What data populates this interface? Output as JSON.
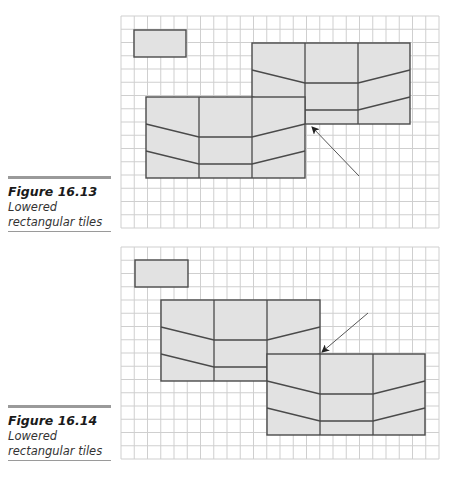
{
  "figures": [
    {
      "caption": {
        "title": "Figure 16.13",
        "line1": "Lowered",
        "line2": "rectangular tiles"
      },
      "grid": {
        "x": 121,
        "y": 16,
        "cols": 24,
        "rows": 16,
        "cell": 13.25
      },
      "small_rect": {
        "x": 134,
        "y": 30,
        "w": 52,
        "h": 27
      },
      "blocks": [
        {
          "x": 252,
          "y": 43,
          "w": 158,
          "h": 81,
          "cols": [
            305,
            358
          ],
          "lines": [
            [
              252,
              70,
              305,
              83,
              358,
              83,
              410,
              70
            ],
            [
              252,
              97,
              305,
              110,
              358,
              110,
              410,
              97
            ]
          ]
        },
        {
          "x": 146,
          "y": 97,
          "w": 159,
          "h": 81,
          "cols": [
            199,
            252
          ],
          "lines": [
            [
              146,
              124,
              199,
              137,
              252,
              137,
              305,
              124
            ],
            [
              146,
              151,
              199,
              164,
              252,
              164,
              305,
              151
            ]
          ]
        }
      ],
      "arrow": {
        "x1": 359,
        "y1": 176,
        "x2": 312,
        "y2": 127
      }
    },
    {
      "caption": {
        "title": "Figure 16.14",
        "line1": "Lowered",
        "line2": "rectangular tiles"
      },
      "grid": {
        "x": 121,
        "y": 247,
        "cols": 24,
        "rows": 16,
        "cell": 13.25
      },
      "small_rect": {
        "x": 135,
        "y": 260,
        "w": 53,
        "h": 27
      },
      "blocks": [
        {
          "x": 161,
          "y": 300,
          "w": 159,
          "h": 81,
          "cols": [
            214,
            267
          ],
          "lines": [
            [
              161,
              327,
              214,
              340,
              267,
              340,
              320,
              327
            ],
            [
              161,
              354,
              214,
              367,
              267,
              367,
              320,
              354
            ]
          ]
        },
        {
          "x": 267,
          "y": 354,
          "w": 158,
          "h": 81,
          "cols": [
            320,
            373
          ],
          "lines": [
            [
              267,
              381,
              320,
              394,
              373,
              394,
              425,
              381
            ],
            [
              267,
              408,
              320,
              421,
              373,
              421,
              425,
              408
            ]
          ]
        }
      ],
      "arrow": {
        "x1": 368,
        "y1": 313,
        "x2": 322,
        "y2": 352
      }
    }
  ],
  "colors": {
    "grid": "#cfcfcf",
    "tile_fill": "#e2e2e2",
    "tile_stroke": "#4a4a4a",
    "arrow": "#555555"
  }
}
